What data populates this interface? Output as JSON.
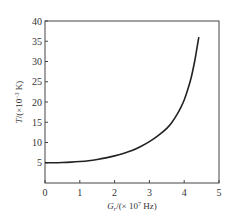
{
  "chart_data": {
    "type": "line",
    "title": "",
    "xlabel": "G_r/(×10^7 Hz)",
    "ylabel": "T/(×10^-3 K)",
    "xlabel_parts": {
      "main": "G",
      "sub": "r",
      "rest": "/(× 10",
      "sup": "7",
      "unit": " Hz)"
    },
    "ylabel_parts": {
      "main": "T",
      "rest": "/(×10",
      "sup": "−3",
      "unit": " K)"
    },
    "xlim": [
      0,
      5
    ],
    "ylim": [
      0,
      40
    ],
    "xticks": [
      "0",
      "1",
      "2",
      "3",
      "4",
      "5"
    ],
    "yticks": [
      "5",
      "10",
      "15",
      "20",
      "25",
      "30",
      "35",
      "40"
    ],
    "grid": false,
    "legend": null,
    "series": [
      {
        "name": "T vs G_r",
        "color": "#222222",
        "x": [
          0,
          0.25,
          0.5,
          0.75,
          1.0,
          1.25,
          1.5,
          1.75,
          2.0,
          2.25,
          2.5,
          2.75,
          3.0,
          3.25,
          3.5,
          3.65,
          3.8,
          3.9,
          4.0,
          4.1,
          4.2,
          4.3,
          4.36,
          4.42
        ],
        "y": [
          5.0,
          5.0,
          5.05,
          5.15,
          5.3,
          5.5,
          5.8,
          6.2,
          6.7,
          7.3,
          8.0,
          9.0,
          10.2,
          11.7,
          13.5,
          15.0,
          17.0,
          18.6,
          20.5,
          23.0,
          26.0,
          30.0,
          33.0,
          36.0
        ]
      }
    ]
  }
}
